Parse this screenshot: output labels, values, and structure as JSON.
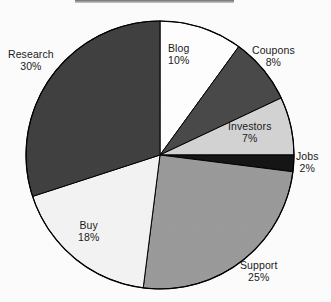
{
  "header": {
    "cropped_title_bar": ""
  },
  "chart_data": {
    "type": "pie",
    "title": "",
    "xlabel": "",
    "ylabel": "",
    "legend_position": "labels-on-slices",
    "grid": false,
    "units": "%",
    "start_angle_deg": 0,
    "direction": "clockwise",
    "center": {
      "x": 160,
      "y": 155
    },
    "radius": 134,
    "outline_color": "#000000",
    "categories": [
      "Blog",
      "Coupons",
      "Investors",
      "Jobs",
      "Support",
      "Buy",
      "Research"
    ],
    "values": [
      10,
      8,
      7,
      2,
      25,
      18,
      30
    ],
    "slices": [
      {
        "name": "Blog",
        "value": 10,
        "label": "Blog",
        "value_label": "10%",
        "color": "#ffffff",
        "label_pos": {
          "x": 168,
          "y": 42
        }
      },
      {
        "name": "Coupons",
        "value": 8,
        "label": "Coupons",
        "value_label": "8%",
        "color": "#4a4a4a",
        "label_pos": {
          "x": 252,
          "y": 44
        }
      },
      {
        "name": "Investors",
        "value": 7,
        "label": "Investors",
        "value_label": "7%",
        "color": "#d4d4d4",
        "label_pos": {
          "x": 228,
          "y": 120
        }
      },
      {
        "name": "Jobs",
        "value": 2,
        "label": "Jobs",
        "value_label": "2%",
        "color": "#151515",
        "label_pos": {
          "x": 296,
          "y": 150
        }
      },
      {
        "name": "Support",
        "value": 25,
        "label": "Support",
        "value_label": "25%",
        "color": "#9b9b9b",
        "label_pos": {
          "x": 240,
          "y": 259
        }
      },
      {
        "name": "Buy",
        "value": 18,
        "label": "Buy",
        "value_label": "18%",
        "color": "#f4f4f4",
        "label_pos": {
          "x": 78,
          "y": 219
        }
      },
      {
        "name": "Research",
        "value": 30,
        "label": "Research",
        "value_label": "30%",
        "color": "#414141",
        "label_pos": {
          "x": 8,
          "y": 48
        }
      }
    ]
  }
}
